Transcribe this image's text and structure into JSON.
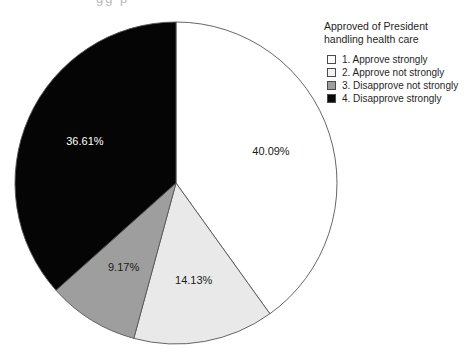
{
  "chart_data": {
    "type": "pie",
    "title": "Approved of President handling health care",
    "legend_position": "top-right",
    "labels_inside": true,
    "start_angle_deg": 0,
    "direction": "clockwise",
    "categories": [
      "1. Approve strongly",
      "2. Approve not strongly",
      "3. Disapprove not strongly",
      "4. Disapprove strongly"
    ],
    "values": [
      40.09,
      14.13,
      9.17,
      36.61
    ],
    "value_labels": [
      "40.09%",
      "14.13%",
      "9.17%",
      "36.61%"
    ],
    "slice_colors": [
      "#ffffff",
      "#e9e9e9",
      "#9e9e9e",
      "#050505"
    ],
    "label_text_colors": [
      "#1a1a1a",
      "#1a1a1a",
      "#1a1a1a",
      "#ffffff"
    ],
    "slice_border_color": "#555555",
    "units": "percent"
  },
  "legend": {
    "title": "Approved of President\nhandling health care",
    "items": [
      {
        "label": "1. Approve strongly",
        "color": "#ffffff"
      },
      {
        "label": "2. Approve not strongly",
        "color": "#f2f2f2"
      },
      {
        "label": "3. Disapprove not strongly",
        "color": "#9e9e9e"
      },
      {
        "label": "4. Disapprove strongly",
        "color": "#0a0a0a"
      }
    ]
  },
  "artifacts": {
    "top_cropped_text": "gg p"
  },
  "geometry": {
    "center_x": 176,
    "center_y": 183,
    "radius": 161,
    "label_radius_factor": 0.62
  }
}
